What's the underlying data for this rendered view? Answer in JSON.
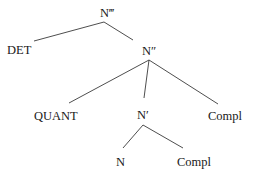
{
  "diagram": {
    "type": "syntax-tree",
    "nodes": {
      "root": {
        "label": "N‴"
      },
      "det": {
        "label": "DET"
      },
      "n2": {
        "label": "N″"
      },
      "quant": {
        "label": "QUANT"
      },
      "n1": {
        "label": "N′"
      },
      "compl1": {
        "label": "Compl"
      },
      "n0": {
        "label": "N"
      },
      "compl0": {
        "label": "Compl"
      }
    },
    "edges": [
      {
        "from": "N‴",
        "to": "DET"
      },
      {
        "from": "N‴",
        "to": "N″"
      },
      {
        "from": "N″",
        "to": "QUANT"
      },
      {
        "from": "N″",
        "to": "N′"
      },
      {
        "from": "N″",
        "to": "Compl"
      },
      {
        "from": "N′",
        "to": "N"
      },
      {
        "from": "N′",
        "to": "Compl"
      }
    ]
  }
}
